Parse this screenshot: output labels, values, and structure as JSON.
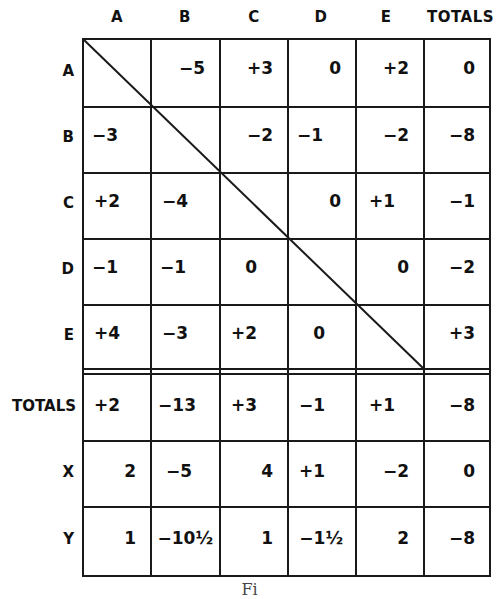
{
  "table": {
    "column_headers": [
      "A",
      "B",
      "C",
      "D",
      "E",
      "TOTALS"
    ],
    "row_headers": [
      "A",
      "B",
      "C",
      "D",
      "E",
      "TOTALS",
      "X",
      "Y"
    ],
    "rows": [
      [
        "",
        "−5",
        "+3",
        "0",
        "+2",
        "0"
      ],
      [
        "−3",
        "",
        "−2",
        "−1",
        "−2",
        "−8"
      ],
      [
        "+2",
        "−4",
        "",
        "0",
        "+1",
        "−1"
      ],
      [
        "−1",
        "−1",
        "0",
        "",
        "0",
        "−2"
      ],
      [
        "+4",
        "−3",
        "+2",
        "0",
        "",
        "+3"
      ],
      [
        "+2",
        "−13",
        "+3",
        "−1",
        "+1",
        "−8"
      ],
      [
        "2",
        "−5",
        "4",
        "+1",
        "−2",
        "0"
      ],
      [
        "1",
        "−10½",
        "1",
        "−1½",
        "2",
        "−8"
      ]
    ]
  },
  "caption": "Fi"
}
